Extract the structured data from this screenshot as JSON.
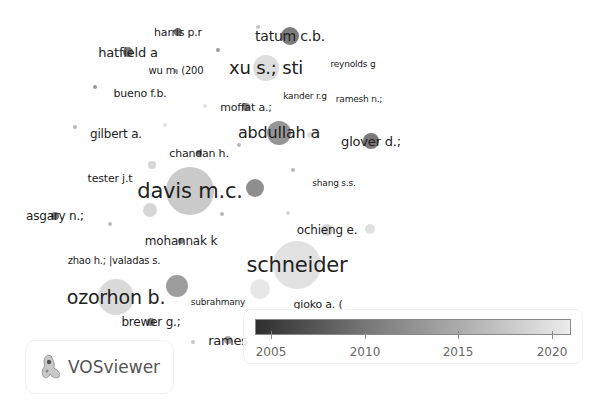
{
  "app": {
    "brand_name": "VOSviewer"
  },
  "legend": {
    "ticks": [
      "2005",
      "2010",
      "2015",
      "2020"
    ],
    "range": [
      2004,
      2021
    ],
    "gradient_colors": [
      "#2f2f2f",
      "#777777",
      "#b5b5b5",
      "#ececec"
    ]
  },
  "chart_data": {
    "type": "network",
    "title": "",
    "color_scale": {
      "label": "Average publication year",
      "min": 2004,
      "max": 2021,
      "ticks": [
        2005,
        2010,
        2015,
        2020
      ]
    },
    "nodes": [
      {
        "label": "harris p.r",
        "x": 178,
        "y": 32,
        "r": 4,
        "color": "#666666",
        "fs": 11
      },
      {
        "label": "hatfield a",
        "x": 128,
        "y": 52,
        "r": 5,
        "color": "#6a6a6a",
        "fs": 13
      },
      {
        "label": "wu m. (200",
        "x": 176,
        "y": 71,
        "r": 2,
        "color": "#888888",
        "fs": 10
      },
      {
        "label": "bueno f.b.",
        "x": 140,
        "y": 93,
        "r": 0,
        "color": "#999999",
        "fs": 11
      },
      {
        "label": "tatum c.b.",
        "x": 290,
        "y": 36,
        "r": 9,
        "color": "#6d6d6d",
        "fs": 14
      },
      {
        "label": "xu s.; sti",
        "x": 266,
        "y": 68,
        "r": 13,
        "color": "#d9d9d9",
        "fs": 18
      },
      {
        "label": "reynolds g",
        "x": 353,
        "y": 64,
        "r": 0,
        "color": "#999999",
        "fs": 9
      },
      {
        "label": "kander r.g",
        "x": 305,
        "y": 96,
        "r": 0,
        "color": "#999999",
        "fs": 9
      },
      {
        "label": "ramesh n.;",
        "x": 359,
        "y": 99,
        "r": 0,
        "color": "#999999",
        "fs": 9
      },
      {
        "label": "moffat a.;",
        "x": 246,
        "y": 107,
        "r": 4,
        "color": "#777777",
        "fs": 11
      },
      {
        "label": "abdullah a",
        "x": 279,
        "y": 133,
        "r": 12,
        "color": "#8a8a8a",
        "fs": 16
      },
      {
        "label": "glover d.;",
        "x": 371,
        "y": 141,
        "r": 8,
        "color": "#6a6a6a",
        "fs": 13
      },
      {
        "label": "gilbert a.",
        "x": 116,
        "y": 134,
        "r": 0,
        "color": "#999999",
        "fs": 12
      },
      {
        "label": "chandan h.",
        "x": 199,
        "y": 153,
        "r": 3,
        "color": "#666666",
        "fs": 11
      },
      {
        "label": "tester j.t",
        "x": 110,
        "y": 178,
        "r": 0,
        "color": "#999999",
        "fs": 11
      },
      {
        "label": "davis m.c.",
        "x": 190,
        "y": 191,
        "r": 24,
        "color": "#c4c4c4",
        "fs": 21
      },
      {
        "label": "shang s.s.",
        "x": 334,
        "y": 183,
        "r": 0,
        "color": "#999999",
        "fs": 9
      },
      {
        "label": "asgary n.;",
        "x": 55,
        "y": 216,
        "r": 4,
        "color": "#666666",
        "fs": 12
      },
      {
        "label": "ochieng e.",
        "x": 327,
        "y": 230,
        "r": 6,
        "color": "#d0d0d0",
        "fs": 12
      },
      {
        "label": "mohannak k",
        "x": 181,
        "y": 241,
        "r": 3,
        "color": "#777777",
        "fs": 12
      },
      {
        "label": "zhao h.; |valadas s.",
        "x": 114,
        "y": 261,
        "r": 0,
        "color": "#999999",
        "fs": 10
      },
      {
        "label": "schneider",
        "x": 297,
        "y": 265,
        "r": 24,
        "color": "#dedede",
        "fs": 21
      },
      {
        "label": "ozorhon b.",
        "x": 116,
        "y": 297,
        "r": 18,
        "color": "#d6d6d6",
        "fs": 19
      },
      {
        "label": "subrahmany",
        "x": 218,
        "y": 302,
        "r": 0,
        "color": "#999999",
        "fs": 9
      },
      {
        "label": "gioko a. (",
        "x": 318,
        "y": 304,
        "r": 0,
        "color": "#999999",
        "fs": 11
      },
      {
        "label": "brewer g.;",
        "x": 151,
        "y": 322,
        "r": 4,
        "color": "#777777",
        "fs": 12
      },
      {
        "label": "rames",
        "x": 228,
        "y": 340,
        "r": 4,
        "color": "#999999",
        "fs": 13
      }
    ],
    "unlabeled_nodes": [
      {
        "x": 255,
        "y": 188,
        "r": 9,
        "color": "#7a7a7a"
      },
      {
        "x": 177,
        "y": 286,
        "r": 11,
        "color": "#8c8c8c"
      },
      {
        "x": 150,
        "y": 210,
        "r": 7,
        "color": "#cfcfcf"
      },
      {
        "x": 152,
        "y": 165,
        "r": 4,
        "color": "#d0d0d0"
      },
      {
        "x": 260,
        "y": 289,
        "r": 10,
        "color": "#e3e3e3"
      },
      {
        "x": 370,
        "y": 229,
        "r": 5,
        "color": "#dcdcdc"
      },
      {
        "x": 218,
        "y": 50,
        "r": 2,
        "color": "#888888"
      },
      {
        "x": 95,
        "y": 87,
        "r": 2,
        "color": "#888888"
      },
      {
        "x": 75,
        "y": 127,
        "r": 2,
        "color": "#aaaaaa"
      },
      {
        "x": 110,
        "y": 224,
        "r": 2,
        "color": "#aaaaaa"
      },
      {
        "x": 293,
        "y": 170,
        "r": 2,
        "color": "#aaaaaa"
      },
      {
        "x": 310,
        "y": 135,
        "r": 3,
        "color": "#dddddd"
      },
      {
        "x": 205,
        "y": 106,
        "r": 2,
        "color": "#dddddd"
      },
      {
        "x": 239,
        "y": 145,
        "r": 2,
        "color": "#aaaaaa"
      },
      {
        "x": 288,
        "y": 213,
        "r": 2,
        "color": "#cccccc"
      },
      {
        "x": 222,
        "y": 214,
        "r": 2,
        "color": "#aaaaaa"
      },
      {
        "x": 193,
        "y": 342,
        "r": 2,
        "color": "#bbbbbb"
      },
      {
        "x": 165,
        "y": 125,
        "r": 2,
        "color": "#dddddd"
      },
      {
        "x": 258,
        "y": 27,
        "r": 2,
        "color": "#bbbbbb"
      },
      {
        "x": 348,
        "y": 183,
        "r": 2,
        "color": "#eeeeee"
      }
    ]
  }
}
